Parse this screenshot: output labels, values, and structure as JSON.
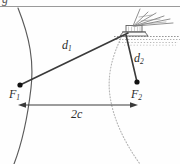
{
  "figure": {
    "title_fragment": "g",
    "labels": {
      "d1": "d",
      "d1_sub": "1",
      "d2": "d",
      "d2_sub": "2",
      "f1": "F",
      "f1_sub": "1",
      "f2": "F",
      "f2_sub": "2",
      "focal_distance": "2c"
    },
    "colors": {
      "line": "#3a3a3a",
      "curve_solid": "#5a5a5a",
      "curve_dotted": "#b4b4b4",
      "rule": "#9a9a9a",
      "ship": "#6a6a6a",
      "water": "#8a8a8a",
      "text": "#2b2b2b",
      "background": "#fefefe"
    },
    "elements": {
      "horizontal_rule": "header-rule",
      "left_branch": "hyperbola-left-branch-solid",
      "right_branch": "hyperbola-right-branch-dotted",
      "focus_1": "focus-point-left",
      "focus_2": "focus-point-right",
      "segment_d1": "distance-segment-d1",
      "segment_d2": "distance-segment-d2",
      "baseline": "focal-axis-double-arrow",
      "ship": "ship-receiver",
      "antenna": "ship-antenna-rays",
      "water": "water-surface-waves"
    }
  }
}
